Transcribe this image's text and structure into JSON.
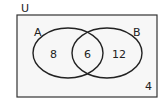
{
  "diagram": {
    "type": "venn",
    "universe_label": "U",
    "sets": [
      {
        "name": "A",
        "only_count": "8"
      },
      {
        "name": "B",
        "only_count": "12"
      }
    ],
    "intersection_count": "6",
    "outside_count": "4"
  }
}
